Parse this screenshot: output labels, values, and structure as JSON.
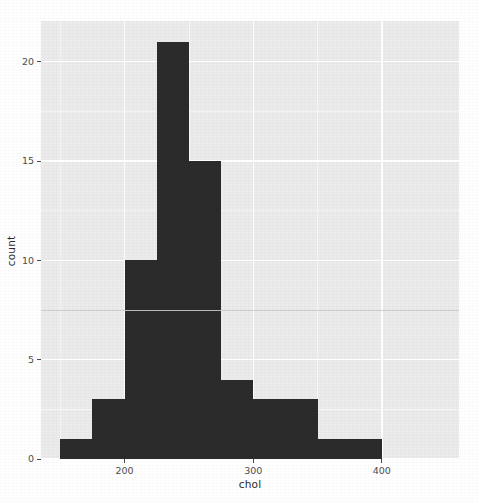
{
  "chart": {
    "xlabel": "chol",
    "ylabel": "count",
    "background": "#ebebeb",
    "bar_color": "#2b2b2b",
    "grid_color": "#ffffff"
  },
  "chart_data": {
    "type": "bar",
    "title": "",
    "subtitle": "",
    "xlabel": "chol",
    "ylabel": "count",
    "xlim": [
      135,
      460
    ],
    "ylim": [
      0,
      22.05
    ],
    "grid": true,
    "legend": null,
    "bin_width": 25,
    "bin_edges": [
      150,
      175,
      200,
      225,
      250,
      275,
      300,
      325,
      350,
      375,
      400
    ],
    "categories": [
      "150-175",
      "175-200",
      "200-225",
      "225-250",
      "250-275",
      "275-300",
      "300-325",
      "325-350",
      "350-375",
      "375-400"
    ],
    "values": [
      1,
      3,
      10,
      21,
      15,
      4,
      3,
      3,
      1,
      1
    ],
    "x_ticks": [
      200,
      300,
      400
    ],
    "x_tick_labels": [
      "200",
      "300",
      "400"
    ],
    "y_ticks": [
      0,
      5,
      10,
      15,
      20
    ],
    "y_tick_labels": [
      "0",
      "5",
      "10",
      "15",
      "20"
    ],
    "y_minor_ticks": [
      2.5,
      7.5,
      12.5,
      17.5
    ],
    "x_minor_ticks": [
      150,
      250,
      350
    ],
    "annotations": []
  }
}
